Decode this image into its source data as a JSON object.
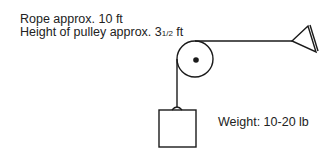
{
  "labels": {
    "rope": "Rope approx. 10 ft",
    "height_prefix": "Height of pulley approx. 3",
    "height_fraction": "1/2",
    "height_suffix": " ft",
    "weight": "Weight: 10-20 lb"
  },
  "components": [
    "pulley",
    "rope",
    "weight-block",
    "anchor-cone"
  ]
}
